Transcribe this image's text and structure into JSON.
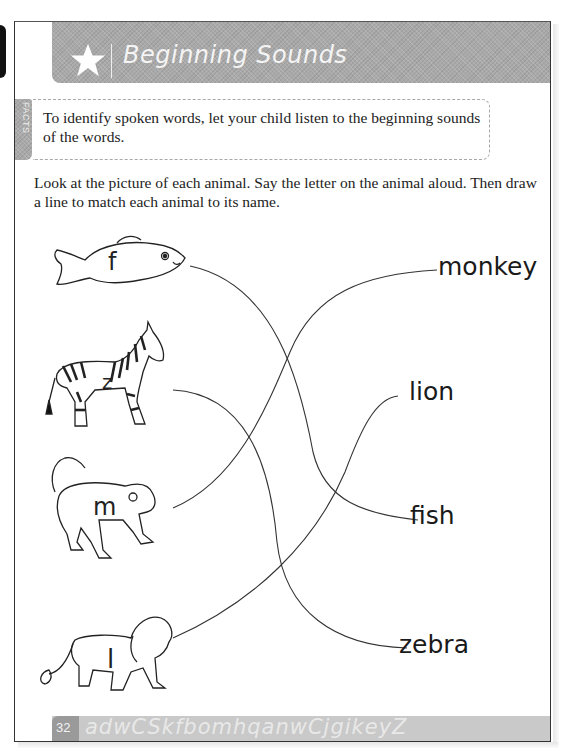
{
  "header": {
    "title": "Beginning Sounds",
    "icon": "star-icon"
  },
  "facts": {
    "label": "FACTS",
    "text": "To identify spoken words, let your child listen to the beginning sounds of the words."
  },
  "instructions": "Look at the picture of each animal. Say the letter on the animal aloud. Then draw a line to match each animal to its name.",
  "animals": [
    {
      "name": "fish",
      "letter": "f"
    },
    {
      "name": "zebra",
      "letter": "z"
    },
    {
      "name": "monkey",
      "letter": "m"
    },
    {
      "name": "lion",
      "letter": "l"
    }
  ],
  "words": [
    "monkey",
    "lion",
    "fish",
    "zebra"
  ],
  "matches": [
    {
      "from": "fish",
      "to": "fish"
    },
    {
      "from": "zebra",
      "to": "zebra"
    },
    {
      "from": "monkey",
      "to": "monkey"
    },
    {
      "from": "lion",
      "to": "lion"
    }
  ],
  "footer": {
    "page_number": "32",
    "decorative_letters": "adwCSkfbomhqanwCjgikeyZ"
  },
  "colors": {
    "band_gray": "#a9a9a9",
    "footer_gray": "#c9c9c9",
    "text": "#222222"
  }
}
